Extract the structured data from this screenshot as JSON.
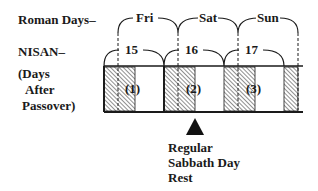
{
  "labels": {
    "roman_days": "Roman Days–",
    "nisan": "NISAN–",
    "days_after_line1": "(Days",
    "days_after_line2": "After",
    "days_after_line3": "Passover)"
  },
  "roman_days": [
    "Fri",
    "Sat",
    "Sun"
  ],
  "nisan_days": [
    "15",
    "16",
    "17"
  ],
  "days_after_passover": [
    "(1)",
    "(2)",
    "(3)"
  ],
  "annotation": {
    "line1": "Regular",
    "line2": "Sabbath Day",
    "line3": "Rest"
  },
  "colors": {
    "ink": "#1a1a1a",
    "background": "#ffffff"
  }
}
